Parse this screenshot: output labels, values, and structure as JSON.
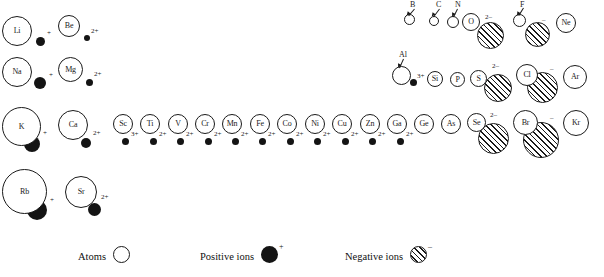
{
  "figure": {
    "type": "periodic-radii-diagram"
  },
  "legend": {
    "items": [
      {
        "label": "Atoms",
        "swatch": "open-circle",
        "charge": ""
      },
      {
        "label": "Positive ions",
        "swatch": "filled-circle",
        "charge": "+"
      },
      {
        "label": "Negative ions",
        "swatch": "hatched-circle",
        "charge": "–"
      }
    ]
  },
  "elements": [
    {
      "symbol": "Li",
      "atom": {
        "x": 2,
        "y": 16,
        "d": 30
      },
      "label_mode": "inside",
      "ion": {
        "kind": "positive",
        "x": 36,
        "y": 37,
        "d": 9
      },
      "charge": "+",
      "charge_x": 47,
      "charge_y": 30
    },
    {
      "symbol": "Be",
      "atom": {
        "x": 58,
        "y": 15,
        "d": 22
      },
      "label_mode": "inside",
      "ion": {
        "kind": "positive",
        "x": 84,
        "y": 35,
        "d": 6
      },
      "charge": "2+",
      "charge_x": 91,
      "charge_y": 28
    },
    {
      "symbol": "B",
      "atom": {
        "x": 404,
        "y": 14,
        "d": 11
      },
      "label_mode": "leader",
      "label_x": 410,
      "label_y": 1,
      "leader_from_x": 414,
      "leader_from_y": 9,
      "leader_to_x": 408,
      "leader_to_y": 16,
      "ion": null,
      "charge": "",
      "charge_x": 0,
      "charge_y": 0
    },
    {
      "symbol": "C",
      "atom": {
        "x": 429,
        "y": 16,
        "d": 10
      },
      "label_mode": "leader",
      "label_x": 436,
      "label_y": 1,
      "leader_from_x": 439,
      "leader_from_y": 9,
      "leader_to_x": 433,
      "leader_to_y": 17,
      "ion": null,
      "charge": "",
      "charge_x": 0,
      "charge_y": 0
    },
    {
      "symbol": "N",
      "atom": {
        "x": 447,
        "y": 16,
        "d": 12
      },
      "label_mode": "leader",
      "label_x": 455,
      "label_y": 1,
      "leader_from_x": 457,
      "leader_from_y": 9,
      "leader_to_x": 453,
      "leader_to_y": 17,
      "ion": null,
      "charge": "",
      "charge_x": 0,
      "charge_y": 0
    },
    {
      "symbol": "O",
      "atom": {
        "x": 462,
        "y": 13,
        "d": 18
      },
      "label_mode": "inside",
      "ion": {
        "kind": "negative",
        "x": 477,
        "y": 22,
        "d": 27
      },
      "charge": "2–",
      "charge_x": 485,
      "charge_y": 14
    },
    {
      "symbol": "F",
      "atom": {
        "x": 513,
        "y": 14,
        "d": 13
      },
      "label_mode": "leader",
      "label_x": 520,
      "label_y": 1,
      "leader_from_x": 523,
      "leader_from_y": 8,
      "leader_to_x": 518,
      "leader_to_y": 16,
      "ion": {
        "kind": "negative",
        "x": 525,
        "y": 22,
        "d": 25
      },
      "charge": "–",
      "charge_x": 542,
      "charge_y": 17
    },
    {
      "symbol": "Ne",
      "atom": {
        "x": 556,
        "y": 13,
        "d": 20
      },
      "label_mode": "inside",
      "ion": null,
      "charge": "",
      "charge_x": 0,
      "charge_y": 0
    },
    {
      "symbol": "Na",
      "atom": {
        "x": 2,
        "y": 57,
        "d": 30
      },
      "label_mode": "inside",
      "ion": {
        "kind": "positive",
        "x": 34,
        "y": 77,
        "d": 12
      },
      "charge": "+",
      "charge_x": 49,
      "charge_y": 72
    },
    {
      "symbol": "Mg",
      "atom": {
        "x": 58,
        "y": 57,
        "d": 25
      },
      "label_mode": "inside",
      "ion": {
        "kind": "positive",
        "x": 86,
        "y": 79,
        "d": 7
      },
      "charge": "2+",
      "charge_x": 94,
      "charge_y": 71
    },
    {
      "symbol": "Al",
      "atom": {
        "x": 392,
        "y": 66,
        "d": 19
      },
      "label_mode": "leader",
      "label_x": 399,
      "label_y": 51,
      "leader_from_x": 403,
      "leader_from_y": 59,
      "leader_to_x": 399,
      "leader_to_y": 68,
      "ion": {
        "kind": "positive",
        "x": 410,
        "y": 79,
        "d": 7
      },
      "charge": "3+",
      "charge_x": 417,
      "charge_y": 73
    },
    {
      "symbol": "Si",
      "atom": {
        "x": 427,
        "y": 71,
        "d": 16
      },
      "label_mode": "inside",
      "ion": null,
      "charge": "",
      "charge_x": 0,
      "charge_y": 0
    },
    {
      "symbol": "P",
      "atom": {
        "x": 450,
        "y": 72,
        "d": 15
      },
      "label_mode": "inside",
      "ion": null,
      "charge": "",
      "charge_x": 0,
      "charge_y": 0
    },
    {
      "symbol": "S",
      "atom": {
        "x": 470,
        "y": 70,
        "d": 17
      },
      "label_mode": "inside",
      "ion": {
        "kind": "negative",
        "x": 484,
        "y": 74,
        "d": 28
      },
      "charge": "2–",
      "charge_x": 492,
      "charge_y": 63
    },
    {
      "symbol": "Cl",
      "atom": {
        "x": 516,
        "y": 64,
        "d": 22
      },
      "label_mode": "inside",
      "ion": {
        "kind": "negative",
        "x": 527,
        "y": 72,
        "d": 31
      },
      "charge": "–",
      "charge_x": 550,
      "charge_y": 66
    },
    {
      "symbol": "Ar",
      "atom": {
        "x": 563,
        "y": 65,
        "d": 24
      },
      "label_mode": "inside",
      "ion": null,
      "charge": "",
      "charge_x": 0,
      "charge_y": 0
    },
    {
      "symbol": "K",
      "atom": {
        "x": 2,
        "y": 107,
        "d": 39
      },
      "label_mode": "inside",
      "ion": {
        "kind": "positive",
        "x": 24,
        "y": 136,
        "d": 16
      },
      "charge": "+",
      "charge_x": 43,
      "charge_y": 130
    },
    {
      "symbol": "Ca",
      "atom": {
        "x": 58,
        "y": 110,
        "d": 30
      },
      "label_mode": "inside",
      "ion": {
        "kind": "positive",
        "x": 81,
        "y": 138,
        "d": 10
      },
      "charge": "2+",
      "charge_x": 93,
      "charge_y": 130
    },
    {
      "symbol": "Sc",
      "atom": {
        "x": 113,
        "y": 114,
        "d": 20
      },
      "label_mode": "inside",
      "ion": {
        "kind": "positive",
        "x": 122,
        "y": 138,
        "d": 7
      },
      "charge": "3+",
      "charge_x": 131,
      "charge_y": 131
    },
    {
      "symbol": "Ti",
      "atom": {
        "x": 140,
        "y": 114,
        "d": 20
      },
      "label_mode": "inside",
      "ion": {
        "kind": "positive",
        "x": 150,
        "y": 138,
        "d": 7
      },
      "charge": "2+",
      "charge_x": 159,
      "charge_y": 131
    },
    {
      "symbol": "V",
      "atom": {
        "x": 168,
        "y": 114,
        "d": 20
      },
      "label_mode": "inside",
      "ion": {
        "kind": "positive",
        "x": 177,
        "y": 138,
        "d": 7
      },
      "charge": "2+",
      "charge_x": 186,
      "charge_y": 131
    },
    {
      "symbol": "Cr",
      "atom": {
        "x": 195,
        "y": 114,
        "d": 20
      },
      "label_mode": "inside",
      "ion": {
        "kind": "positive",
        "x": 205,
        "y": 138,
        "d": 7
      },
      "charge": "2+",
      "charge_x": 214,
      "charge_y": 131
    },
    {
      "symbol": "Mn",
      "atom": {
        "x": 222,
        "y": 114,
        "d": 20
      },
      "label_mode": "inside",
      "ion": {
        "kind": "positive",
        "x": 232,
        "y": 138,
        "d": 7
      },
      "charge": "2+",
      "charge_x": 241,
      "charge_y": 131
    },
    {
      "symbol": "Fe",
      "atom": {
        "x": 250,
        "y": 114,
        "d": 20
      },
      "label_mode": "inside",
      "ion": {
        "kind": "positive",
        "x": 259,
        "y": 138,
        "d": 7
      },
      "charge": "2+",
      "charge_x": 268,
      "charge_y": 131
    },
    {
      "symbol": "Co",
      "atom": {
        "x": 277,
        "y": 114,
        "d": 20
      },
      "label_mode": "inside",
      "ion": {
        "kind": "positive",
        "x": 287,
        "y": 138,
        "d": 7
      },
      "charge": "2+",
      "charge_x": 296,
      "charge_y": 131
    },
    {
      "symbol": "Ni",
      "atom": {
        "x": 305,
        "y": 114,
        "d": 20
      },
      "label_mode": "inside",
      "ion": {
        "kind": "positive",
        "x": 314,
        "y": 138,
        "d": 7
      },
      "charge": "2+",
      "charge_x": 323,
      "charge_y": 131
    },
    {
      "symbol": "Cu",
      "atom": {
        "x": 332,
        "y": 114,
        "d": 20
      },
      "label_mode": "inside",
      "ion": {
        "kind": "positive",
        "x": 342,
        "y": 138,
        "d": 7
      },
      "charge": "2+",
      "charge_x": 351,
      "charge_y": 131
    },
    {
      "symbol": "Zn",
      "atom": {
        "x": 360,
        "y": 114,
        "d": 20
      },
      "label_mode": "inside",
      "ion": {
        "kind": "positive",
        "x": 369,
        "y": 138,
        "d": 7
      },
      "charge": "2+",
      "charge_x": 378,
      "charge_y": 131
    },
    {
      "symbol": "Ga",
      "atom": {
        "x": 387,
        "y": 114,
        "d": 20
      },
      "label_mode": "inside",
      "ion": {
        "kind": "positive",
        "x": 397,
        "y": 138,
        "d": 7
      },
      "charge": "2+",
      "charge_x": 406,
      "charge_y": 131
    },
    {
      "symbol": "Ge",
      "atom": {
        "x": 414,
        "y": 114,
        "d": 20
      },
      "label_mode": "inside",
      "ion": null,
      "charge": "",
      "charge_x": 0,
      "charge_y": 0
    },
    {
      "symbol": "As",
      "atom": {
        "x": 441,
        "y": 114,
        "d": 20
      },
      "label_mode": "inside",
      "ion": null,
      "charge": "",
      "charge_x": 0,
      "charge_y": 0
    },
    {
      "symbol": "Se",
      "atom": {
        "x": 467,
        "y": 113,
        "d": 19
      },
      "label_mode": "inside",
      "ion": {
        "kind": "negative",
        "x": 478,
        "y": 123,
        "d": 31
      },
      "charge": "2–",
      "charge_x": 490,
      "charge_y": 112
    },
    {
      "symbol": "Br",
      "atom": {
        "x": 513,
        "y": 110,
        "d": 25
      },
      "label_mode": "inside",
      "ion": {
        "kind": "negative",
        "x": 523,
        "y": 122,
        "d": 36
      },
      "charge": "–",
      "charge_x": 550,
      "charge_y": 115
    },
    {
      "symbol": "Kr",
      "atom": {
        "x": 563,
        "y": 110,
        "d": 26
      },
      "label_mode": "inside",
      "ion": null,
      "charge": "",
      "charge_x": 0,
      "charge_y": 0
    },
    {
      "symbol": "Rb",
      "atom": {
        "x": 2,
        "y": 169,
        "d": 45
      },
      "label_mode": "inside",
      "ion": {
        "kind": "positive",
        "x": 27,
        "y": 200,
        "d": 20
      },
      "charge": "+",
      "charge_x": 50,
      "charge_y": 197
    },
    {
      "symbol": "Sr",
      "atom": {
        "x": 65,
        "y": 176,
        "d": 32
      },
      "label_mode": "inside",
      "ion": {
        "kind": "positive",
        "x": 88,
        "y": 203,
        "d": 13
      },
      "charge": "2+",
      "charge_x": 101,
      "charge_y": 194
    }
  ]
}
